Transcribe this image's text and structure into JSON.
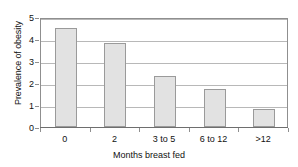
{
  "chart_data": {
    "type": "bar",
    "title": "",
    "xlabel": "Months breast fed",
    "ylabel": "Prevalence of obesity",
    "categories": [
      "0",
      "2",
      "3 to 5",
      "6 to 12",
      ">12"
    ],
    "values": [
      4.5,
      3.8,
      2.3,
      1.75,
      0.8
    ],
    "ylim": [
      0,
      5
    ],
    "ytick_labels": [
      "0",
      "1",
      "2",
      "3",
      "4",
      "5"
    ],
    "ytick_values": [
      0,
      1,
      2,
      3,
      4,
      5
    ],
    "grid": "horizontal",
    "legend": "none",
    "bar_fill_color": "#e2e2e2",
    "bar_edge_color": "#9a9a9a",
    "gridline_color": "#b8b8b8",
    "axis_color": "#8f8f8f",
    "background_color": "#ffffff"
  }
}
